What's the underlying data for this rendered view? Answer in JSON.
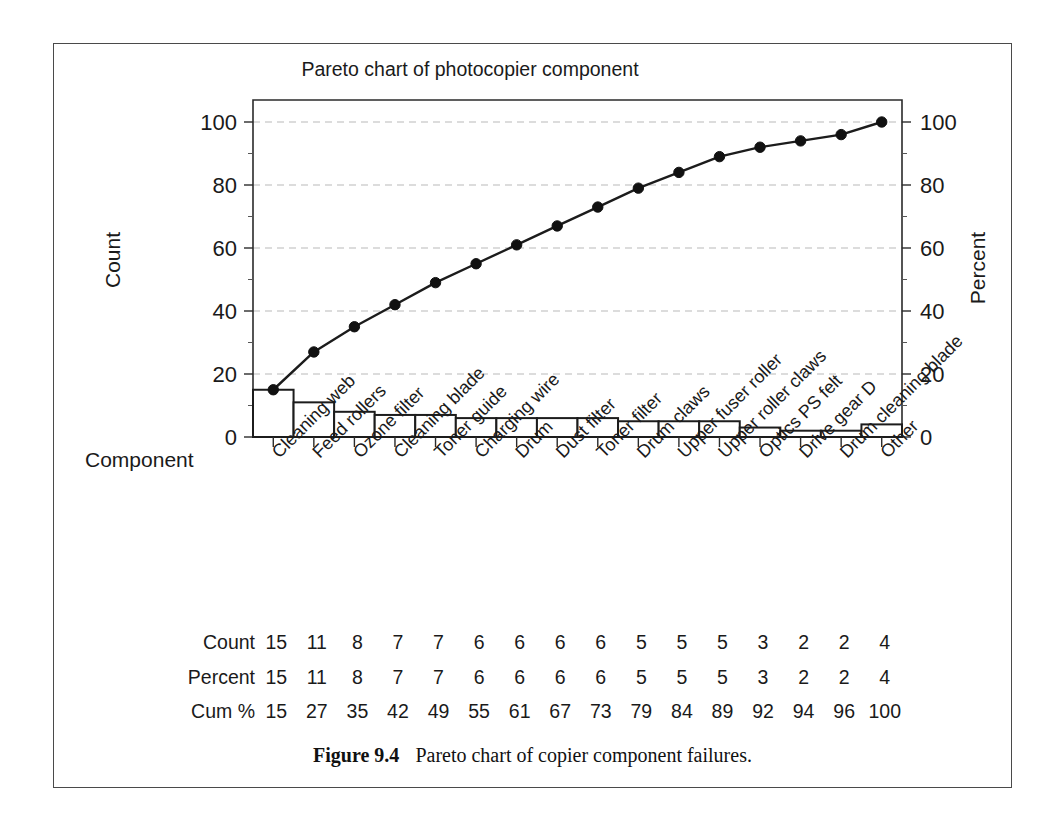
{
  "figure": {
    "caption_label": "Figure 9.4",
    "caption_text": "Pareto chart of copier component failures."
  },
  "chart_data": {
    "type": "bar",
    "title": "Pareto chart of photocopier component",
    "xlabel": "Component",
    "ylabel": "Count",
    "y2label": "Percent",
    "ylim": [
      0,
      100
    ],
    "y2lim": [
      0,
      100
    ],
    "yticks": [
      0,
      20,
      40,
      60,
      80,
      100
    ],
    "y2ticks": [
      0,
      20,
      40,
      60,
      80,
      100
    ],
    "grid": true,
    "legend": "none",
    "categories": [
      "Cleaning web",
      "Feed rollers",
      "Ozone filter",
      "Cleaning blade",
      "Toner guide",
      "Charging wire",
      "Drum",
      "Dust filter",
      "Toner filter",
      "Drum claws",
      "Upper fuser roller",
      "Upper roller claws",
      "Optics PS felt",
      "Drive gear D",
      "Drum cleaning blade",
      "Other"
    ],
    "values": [
      15,
      11,
      8,
      7,
      7,
      6,
      6,
      6,
      6,
      5,
      5,
      5,
      3,
      2,
      2,
      4
    ],
    "series": [
      {
        "name": "Count",
        "type": "bar",
        "values": [
          15,
          11,
          8,
          7,
          7,
          6,
          6,
          6,
          6,
          5,
          5,
          5,
          3,
          2,
          2,
          4
        ]
      },
      {
        "name": "Cum %",
        "type": "line",
        "axis": "right",
        "values": [
          15,
          27,
          35,
          42,
          49,
          55,
          61,
          67,
          73,
          79,
          84,
          89,
          92,
          94,
          96,
          100
        ]
      }
    ]
  },
  "data_table": {
    "rows": [
      {
        "label": "Count",
        "values": [
          15,
          11,
          8,
          7,
          7,
          6,
          6,
          6,
          6,
          5,
          5,
          5,
          3,
          2,
          2,
          4
        ]
      },
      {
        "label": "Percent",
        "values": [
          15,
          11,
          8,
          7,
          7,
          6,
          6,
          6,
          6,
          5,
          5,
          5,
          3,
          2,
          2,
          4
        ]
      },
      {
        "label": "Cum %",
        "values": [
          15,
          27,
          35,
          42,
          49,
          55,
          61,
          67,
          73,
          79,
          84,
          89,
          92,
          94,
          96,
          100
        ]
      }
    ]
  },
  "style": {
    "bar_fill": "#ffffff",
    "bar_stroke": "#1c1c1c",
    "line_color": "#1c1c1c",
    "grid_color": "#b9b9b9",
    "axis_color": "#2b2b2b",
    "text_color": "#1a1a1a",
    "frame_color": "#4a4a4a",
    "background": "#ffffff"
  }
}
